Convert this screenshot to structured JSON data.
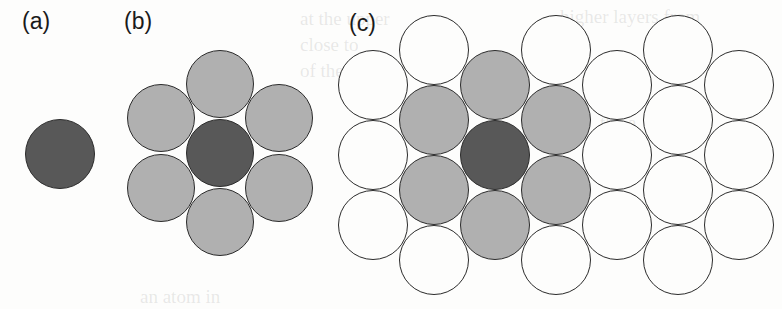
{
  "figure": {
    "background_color": "#fdfdfc",
    "width": 782,
    "height": 309,
    "outline_color": "#2b2b2b",
    "panels": [
      {
        "id": "a",
        "label": "(a)",
        "label_x": 22,
        "label_y": 10
      },
      {
        "id": "b",
        "label": "(b)",
        "label_x": 124,
        "label_y": 10
      },
      {
        "id": "c",
        "label": "(c)",
        "label_x": 349,
        "label_y": 12
      }
    ]
  },
  "legend": {
    "shell_colors": {
      "central": "#585858",
      "first_shell": "#b0b0b0",
      "second_shell": "#fdfdfc"
    }
  },
  "chart_data": {
    "type": "scatter",
    "xlabel": "",
    "ylabel": "",
    "circle_diameter": 70,
    "panels": [
      {
        "id": "a",
        "label": "(a)",
        "caption": "central atom only",
        "circles": [
          {
            "x": 60,
            "y": 154,
            "d": 70,
            "shell": "central",
            "fill": "#585858"
          }
        ]
      },
      {
        "id": "b",
        "label": "(b)",
        "caption": "central atom with first coordination shell",
        "circles": [
          {
            "x": 220,
            "y": 153,
            "d": 68,
            "shell": "central",
            "fill": "#585858"
          },
          {
            "x": 220,
            "y": 84,
            "d": 68,
            "shell": "first",
            "fill": "#b0b0b0"
          },
          {
            "x": 220,
            "y": 222,
            "d": 68,
            "shell": "first",
            "fill": "#b0b0b0"
          },
          {
            "x": 161,
            "y": 118,
            "d": 68,
            "shell": "first",
            "fill": "#b0b0b0"
          },
          {
            "x": 161,
            "y": 188,
            "d": 68,
            "shell": "first",
            "fill": "#b0b0b0"
          },
          {
            "x": 279,
            "y": 118,
            "d": 68,
            "shell": "first",
            "fill": "#b0b0b0"
          },
          {
            "x": 279,
            "y": 188,
            "d": 68,
            "shell": "first",
            "fill": "#b0b0b0"
          }
        ]
      },
      {
        "id": "c",
        "label": "(c)",
        "caption": "central atom with first and second coordination shells",
        "circles": [
          {
            "x": 495,
            "y": 155,
            "d": 70,
            "shell": "central",
            "fill": "#585858"
          },
          {
            "x": 495,
            "y": 85,
            "d": 70,
            "shell": "first",
            "fill": "#b0b0b0"
          },
          {
            "x": 495,
            "y": 225,
            "d": 70,
            "shell": "first",
            "fill": "#b0b0b0"
          },
          {
            "x": 434,
            "y": 120,
            "d": 70,
            "shell": "first",
            "fill": "#b0b0b0"
          },
          {
            "x": 434,
            "y": 190,
            "d": 70,
            "shell": "first",
            "fill": "#b0b0b0"
          },
          {
            "x": 556,
            "y": 120,
            "d": 70,
            "shell": "first",
            "fill": "#b0b0b0"
          },
          {
            "x": 556,
            "y": 190,
            "d": 70,
            "shell": "first",
            "fill": "#b0b0b0"
          },
          {
            "x": 434,
            "y": 50,
            "d": 70,
            "shell": "second",
            "fill": "#fdfdfc"
          },
          {
            "x": 556,
            "y": 50,
            "d": 70,
            "shell": "second",
            "fill": "#fdfdfc"
          },
          {
            "x": 373,
            "y": 85,
            "d": 70,
            "shell": "second",
            "fill": "#fdfdfc"
          },
          {
            "x": 617,
            "y": 85,
            "d": 70,
            "shell": "second",
            "fill": "#fdfdfc"
          },
          {
            "x": 373,
            "y": 155,
            "d": 70,
            "shell": "second",
            "fill": "#fdfdfc"
          },
          {
            "x": 617,
            "y": 155,
            "d": 70,
            "shell": "second",
            "fill": "#fdfdfc"
          },
          {
            "x": 373,
            "y": 225,
            "d": 70,
            "shell": "second",
            "fill": "#fdfdfc"
          },
          {
            "x": 617,
            "y": 225,
            "d": 70,
            "shell": "second",
            "fill": "#fdfdfc"
          },
          {
            "x": 434,
            "y": 260,
            "d": 70,
            "shell": "second",
            "fill": "#fdfdfc"
          },
          {
            "x": 556,
            "y": 260,
            "d": 70,
            "shell": "second",
            "fill": "#fdfdfc"
          },
          {
            "x": 678,
            "y": 50,
            "d": 70,
            "shell": "outer",
            "fill": "#fdfdfc"
          },
          {
            "x": 678,
            "y": 120,
            "d": 70,
            "shell": "outer",
            "fill": "#fdfdfc"
          },
          {
            "x": 678,
            "y": 190,
            "d": 70,
            "shell": "outer",
            "fill": "#fdfdfc"
          },
          {
            "x": 678,
            "y": 260,
            "d": 70,
            "shell": "outer",
            "fill": "#fdfdfc"
          },
          {
            "x": 739,
            "y": 85,
            "d": 70,
            "shell": "outer",
            "fill": "#fdfdfc"
          },
          {
            "x": 739,
            "y": 155,
            "d": 70,
            "shell": "outer",
            "fill": "#fdfdfc"
          },
          {
            "x": 739,
            "y": 225,
            "d": 70,
            "shell": "outer",
            "fill": "#fdfdfc"
          }
        ]
      }
    ]
  },
  "bleed_text": [
    {
      "text": "at the upper",
      "x": 300,
      "y": 8
    },
    {
      "text": "close to",
      "x": 300,
      "y": 34
    },
    {
      "text": "of the surf",
      "x": 300,
      "y": 60
    },
    {
      "text": "higher layers from",
      "x": 560,
      "y": 6
    },
    {
      "text": "the a",
      "x": 600,
      "y": 112
    },
    {
      "text": "will be",
      "x": 590,
      "y": 152
    },
    {
      "text": "the layer",
      "x": 590,
      "y": 196
    },
    {
      "text": "an atom in",
      "x": 140,
      "y": 286
    }
  ]
}
